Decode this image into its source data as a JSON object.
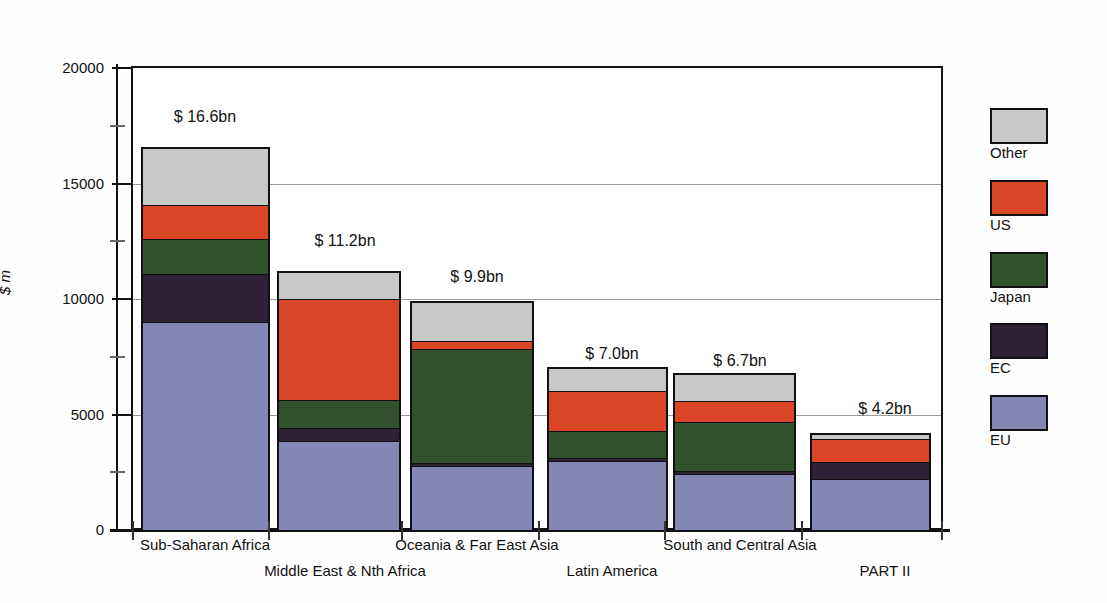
{
  "chart_data": {
    "type": "bar",
    "stacked": true,
    "title": "",
    "xlabel": "",
    "ylabel": "$ m",
    "ylim": [
      0,
      20000
    ],
    "yticks": [
      0,
      5000,
      10000,
      15000,
      20000
    ],
    "ytick_labels": [
      "0",
      "5000",
      "10000",
      "15000",
      "20000"
    ],
    "yminor_ticks": [
      2500,
      7500,
      12500,
      17500
    ],
    "grid": "horizontal",
    "legend_position": "right",
    "categories": [
      "Sub-Saharan Africa",
      "Middle East & Nth Africa",
      "Oceania & Far East Asia",
      "Latin America",
      "South and Central Asia",
      "PART II"
    ],
    "series": [
      {
        "name": "EU",
        "color": "#8487b5",
        "values": [
          9000,
          3850,
          2750,
          3000,
          2400,
          2200
        ]
      },
      {
        "name": "EC",
        "color": "#2e2136",
        "values": [
          2100,
          550,
          150,
          100,
          150,
          750
        ]
      },
      {
        "name": "Japan",
        "color": "#33502f",
        "values": [
          1500,
          1250,
          4950,
          1200,
          2150,
          0
        ]
      },
      {
        "name": "US",
        "color": "#d94526",
        "values": [
          1500,
          4400,
          350,
          1750,
          900,
          1050
        ]
      },
      {
        "name": "Other",
        "color": "#c8c8c8",
        "values": [
          2500,
          1150,
          1700,
          1000,
          1200,
          200
        ]
      }
    ],
    "totals_labels": [
      "$ 16.6bn",
      "$ 11.2bn",
      "$ 9.9bn",
      "$ 7.0bn",
      "$ 6.7bn",
      "$ 4.2bn"
    ],
    "totals": [
      16600,
      11200,
      9900,
      7050,
      6800,
      4200
    ]
  },
  "legend": {
    "items": [
      {
        "label": "Other",
        "color": "#c8c8c8"
      },
      {
        "label": "US",
        "color": "#d94526"
      },
      {
        "label": "Japan",
        "color": "#33502f"
      },
      {
        "label": "EC",
        "color": "#2e2136"
      },
      {
        "label": "EU",
        "color": "#8487b5"
      }
    ]
  }
}
